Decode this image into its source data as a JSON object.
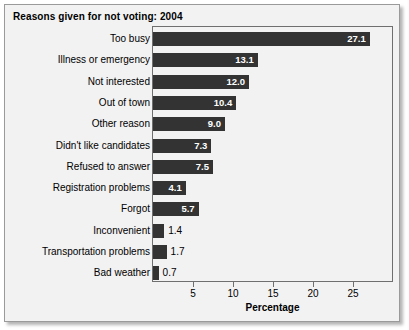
{
  "figure": {
    "title": "Reasons given for not voting: 2004",
    "xaxis_title": "Percentage"
  },
  "chart_data": {
    "type": "bar",
    "orientation": "horizontal",
    "title": "Reasons given for not voting: 2004",
    "xlabel": "Percentage",
    "ylabel": "",
    "xlim": [
      0,
      30.1
    ],
    "xticks": [
      5,
      10,
      15,
      20,
      25
    ],
    "grid": false,
    "legend": null,
    "bar_color": "#333333",
    "panel_background": "#f2f2f2",
    "categories": [
      "Too busy",
      "Illness or emergency",
      "Not interested",
      "Out of town",
      "Other reason",
      "Didn't like candidates",
      "Refused to answer",
      "Registration problems",
      "Forgot",
      "Inconvenient",
      "Transportation problems",
      "Bad weather"
    ],
    "values": [
      27.1,
      13.1,
      12.0,
      10.4,
      9.0,
      7.3,
      7.5,
      4.1,
      5.7,
      1.4,
      1.7,
      0.7
    ],
    "value_labels": [
      "27.1",
      "13.1",
      "12.0",
      "10.4",
      "9.0",
      "7.3",
      "7.5",
      "4.1",
      "5.7",
      "1.4",
      "1.7",
      "0.7"
    ],
    "label_placement": [
      "inside",
      "inside",
      "inside",
      "inside",
      "inside",
      "inside",
      "inside",
      "inside",
      "inside",
      "outside",
      "outside",
      "outside"
    ]
  }
}
